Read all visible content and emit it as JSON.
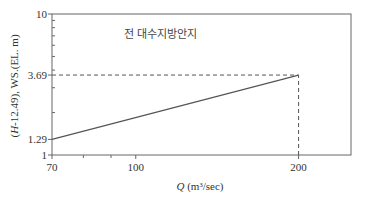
{
  "chart_data": {
    "type": "line",
    "title": "",
    "xlabel_italic": "Q",
    "xlabel_rest": " (m³/sec)",
    "ylabel_italic": "H",
    "ylabel_rest": "-12.49), WS.(EL. m)",
    "ylabel_open": "(",
    "x_scale": "log",
    "y_scale": "log",
    "xlim": [
      70,
      250
    ],
    "ylim": [
      1,
      10
    ],
    "x_ticks": [
      70,
      100,
      200
    ],
    "x_tick_labels": [
      "70",
      "100",
      "200"
    ],
    "x_minor_ticks": [
      80,
      90
    ],
    "y_ticks": [
      1,
      1.29,
      3.69,
      10
    ],
    "y_tick_labels": [
      "1",
      "1.29",
      "3.69",
      "10"
    ],
    "y_minor_ticks": [
      2,
      3,
      4,
      5,
      6,
      7,
      8,
      9
    ],
    "series": [
      {
        "name": "Stage-discharge",
        "x": [
          70,
          200
        ],
        "y": [
          1.29,
          3.69
        ]
      }
    ],
    "reference_lines": [
      {
        "type": "horizontal",
        "y": 3.69,
        "x_to": 200,
        "style": "dashed"
      },
      {
        "type": "vertical",
        "x": 200,
        "y_from": 1,
        "y_to": 3.69,
        "style": "dashed"
      }
    ],
    "annotations": [
      {
        "text": "전 대수지방안지",
        "x": 95,
        "y": 6.8
      }
    ],
    "grid": false,
    "line_color": "#555555",
    "axis_color": "#666666"
  }
}
